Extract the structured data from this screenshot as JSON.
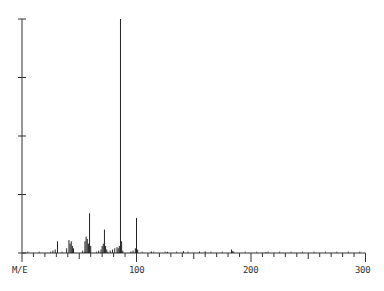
{
  "chart_data": {
    "type": "bar",
    "title": "",
    "xlabel": "M/E",
    "ylabel": "",
    "xlim": [
      0,
      300
    ],
    "ylim": [
      0,
      100
    ],
    "x_ticks": [
      100,
      200,
      300
    ],
    "x_tick_labels": [
      "100",
      "200",
      "300"
    ],
    "y_ticks": [
      0,
      25,
      50,
      75,
      100
    ],
    "grid": false,
    "legend": null,
    "peaks": [
      {
        "mz": 27,
        "intensity": 1
      },
      {
        "mz": 29,
        "intensity": 1.5
      },
      {
        "mz": 31,
        "intensity": 5
      },
      {
        "mz": 39,
        "intensity": 2
      },
      {
        "mz": 41,
        "intensity": 5.5
      },
      {
        "mz": 42,
        "intensity": 4
      },
      {
        "mz": 43,
        "intensity": 5
      },
      {
        "mz": 44,
        "intensity": 3
      },
      {
        "mz": 45,
        "intensity": 2
      },
      {
        "mz": 53,
        "intensity": 1
      },
      {
        "mz": 55,
        "intensity": 5
      },
      {
        "mz": 56,
        "intensity": 7
      },
      {
        "mz": 57,
        "intensity": 6
      },
      {
        "mz": 58,
        "intensity": 4
      },
      {
        "mz": 59,
        "intensity": 17
      },
      {
        "mz": 60,
        "intensity": 3
      },
      {
        "mz": 67,
        "intensity": 1
      },
      {
        "mz": 69,
        "intensity": 1.5
      },
      {
        "mz": 70,
        "intensity": 3
      },
      {
        "mz": 71,
        "intensity": 4
      },
      {
        "mz": 72,
        "intensity": 10
      },
      {
        "mz": 73,
        "intensity": 3
      },
      {
        "mz": 74,
        "intensity": 1.5
      },
      {
        "mz": 77,
        "intensity": 1
      },
      {
        "mz": 79,
        "intensity": 1.5
      },
      {
        "mz": 81,
        "intensity": 2
      },
      {
        "mz": 83,
        "intensity": 2.5
      },
      {
        "mz": 84,
        "intensity": 2
      },
      {
        "mz": 85,
        "intensity": 3
      },
      {
        "mz": 86,
        "intensity": 100
      },
      {
        "mz": 87,
        "intensity": 5
      },
      {
        "mz": 88,
        "intensity": 1
      },
      {
        "mz": 95,
        "intensity": 0.5
      },
      {
        "mz": 97,
        "intensity": 1
      },
      {
        "mz": 99,
        "intensity": 2
      },
      {
        "mz": 100,
        "intensity": 15
      },
      {
        "mz": 101,
        "intensity": 1.5
      },
      {
        "mz": 113,
        "intensity": 0.7
      },
      {
        "mz": 127,
        "intensity": 0.5
      },
      {
        "mz": 141,
        "intensity": 0.8
      },
      {
        "mz": 155,
        "intensity": 0.5
      },
      {
        "mz": 160,
        "intensity": 0.7
      },
      {
        "mz": 183,
        "intensity": 1.5
      },
      {
        "mz": 184,
        "intensity": 0.8
      },
      {
        "mz": 213,
        "intensity": 0.4
      }
    ]
  },
  "labels": {
    "x_axis_name": "M/E",
    "tick_100": "100",
    "tick_200": "200",
    "tick_300": "300"
  },
  "colors": {
    "axis": "#333333",
    "peak": "#222222",
    "background": "#ffffff"
  }
}
